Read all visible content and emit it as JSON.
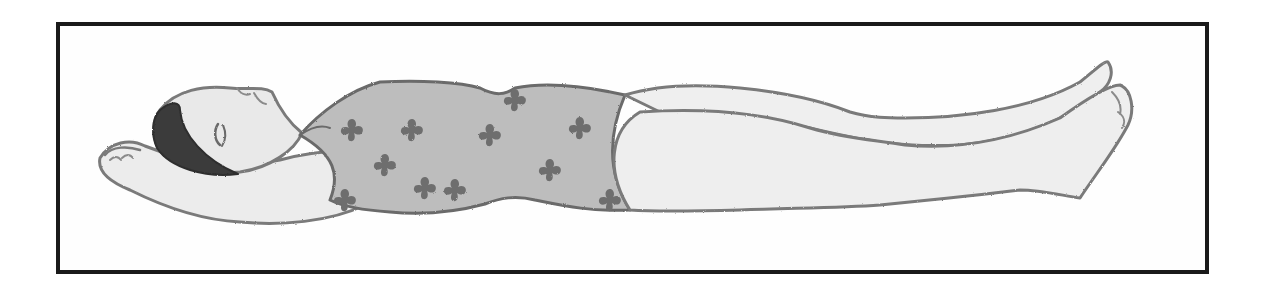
{
  "image": {
    "description": "Pencil illustration of a woman lying flat on her back with arms bent behind her head and legs extended (relaxation / corpse pose), wearing a floral one-piece swimsuit, framed by a black rectangular border",
    "style": "grayscale pencil sketch",
    "colors": {
      "frame": "#1a1a1a",
      "background": "#ffffff",
      "skin_fill": "#ebebeb",
      "outline": "#7a7a7a",
      "hair": "#3a3a3a",
      "swimsuit_fill": "#bdbdbd",
      "flower_fill": "#6e6e6e"
    }
  }
}
